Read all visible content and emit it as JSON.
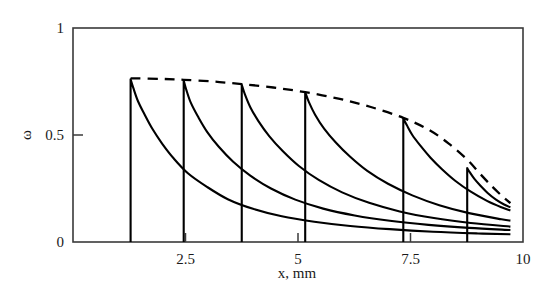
{
  "chart_data": {
    "type": "line",
    "title": "",
    "xlabel": "x, mm",
    "ylabel": "ω",
    "xlim": [
      0,
      10
    ],
    "ylim": [
      0,
      1
    ],
    "grid": false,
    "legend": "none",
    "xticks": [
      {
        "value": 2.5,
        "label": "2.5"
      },
      {
        "value": 5,
        "label": "5"
      },
      {
        "value": 7.5,
        "label": "7.5"
      },
      {
        "value": 10,
        "label": "10"
      }
    ],
    "yticks": [
      {
        "value": 0,
        "label": "0"
      },
      {
        "value": 0.5,
        "label": "0.5"
      },
      {
        "value": 1,
        "label": "1"
      }
    ],
    "series": [
      {
        "name": "profile-1",
        "style": "solid",
        "front_x": 1.28,
        "peak_y": 0.76,
        "points": [
          [
            1.28,
            0.0
          ],
          [
            1.28,
            0.76
          ],
          [
            1.34,
            0.72
          ],
          [
            1.44,
            0.66
          ],
          [
            1.58,
            0.6
          ],
          [
            1.76,
            0.53
          ],
          [
            1.98,
            0.46
          ],
          [
            2.24,
            0.39
          ],
          [
            2.56,
            0.32
          ],
          [
            2.96,
            0.26
          ],
          [
            3.44,
            0.2
          ],
          [
            4.0,
            0.155
          ],
          [
            4.64,
            0.12
          ],
          [
            5.36,
            0.095
          ],
          [
            6.16,
            0.075
          ],
          [
            7.04,
            0.06
          ],
          [
            8.0,
            0.048
          ],
          [
            9.0,
            0.04
          ],
          [
            9.72,
            0.036
          ]
        ]
      },
      {
        "name": "profile-2",
        "style": "solid",
        "front_x": 2.46,
        "peak_y": 0.755,
        "points": [
          [
            2.46,
            0.0
          ],
          [
            2.46,
            0.755
          ],
          [
            2.52,
            0.71
          ],
          [
            2.62,
            0.65
          ],
          [
            2.78,
            0.585
          ],
          [
            2.98,
            0.515
          ],
          [
            3.24,
            0.445
          ],
          [
            3.56,
            0.375
          ],
          [
            3.94,
            0.31
          ],
          [
            4.4,
            0.25
          ],
          [
            4.94,
            0.198
          ],
          [
            5.56,
            0.156
          ],
          [
            6.26,
            0.124
          ],
          [
            7.04,
            0.099
          ],
          [
            7.9,
            0.08
          ],
          [
            8.8,
            0.066
          ],
          [
            9.72,
            0.056
          ]
        ]
      },
      {
        "name": "profile-3",
        "style": "solid",
        "front_x": 3.75,
        "peak_y": 0.735,
        "points": [
          [
            3.75,
            0.0
          ],
          [
            3.75,
            0.735
          ],
          [
            3.82,
            0.69
          ],
          [
            3.94,
            0.63
          ],
          [
            4.12,
            0.565
          ],
          [
            4.36,
            0.495
          ],
          [
            4.66,
            0.425
          ],
          [
            5.02,
            0.355
          ],
          [
            5.46,
            0.29
          ],
          [
            5.98,
            0.232
          ],
          [
            6.58,
            0.183
          ],
          [
            7.26,
            0.143
          ],
          [
            8.02,
            0.112
          ],
          [
            8.84,
            0.089
          ],
          [
            9.72,
            0.072
          ]
        ]
      },
      {
        "name": "profile-4",
        "style": "solid",
        "front_x": 5.16,
        "peak_y": 0.7,
        "points": [
          [
            5.16,
            0.0
          ],
          [
            5.16,
            0.7
          ],
          [
            5.24,
            0.655
          ],
          [
            5.38,
            0.595
          ],
          [
            5.58,
            0.53
          ],
          [
            5.84,
            0.465
          ],
          [
            6.16,
            0.398
          ],
          [
            6.54,
            0.332
          ],
          [
            7.0,
            0.272
          ],
          [
            7.54,
            0.218
          ],
          [
            8.14,
            0.172
          ],
          [
            8.8,
            0.135
          ],
          [
            9.52,
            0.106
          ],
          [
            9.72,
            0.1
          ]
        ]
      },
      {
        "name": "profile-5",
        "style": "solid",
        "front_x": 7.34,
        "peak_y": 0.578,
        "points": [
          [
            7.34,
            0.0
          ],
          [
            7.34,
            0.578
          ],
          [
            7.42,
            0.545
          ],
          [
            7.54,
            0.5
          ],
          [
            7.72,
            0.45
          ],
          [
            7.94,
            0.395
          ],
          [
            8.2,
            0.34
          ],
          [
            8.5,
            0.285
          ],
          [
            8.84,
            0.235
          ],
          [
            9.2,
            0.192
          ],
          [
            9.52,
            0.162
          ],
          [
            9.72,
            0.147
          ]
        ]
      },
      {
        "name": "profile-6",
        "style": "solid",
        "front_x": 8.76,
        "peak_y": 0.345,
        "points": [
          [
            8.76,
            0.0
          ],
          [
            8.76,
            0.345
          ],
          [
            8.82,
            0.325
          ],
          [
            8.92,
            0.295
          ],
          [
            9.06,
            0.262
          ],
          [
            9.22,
            0.228
          ],
          [
            9.4,
            0.198
          ],
          [
            9.58,
            0.175
          ],
          [
            9.72,
            0.162
          ]
        ]
      },
      {
        "name": "envelope",
        "style": "dashed",
        "points": [
          [
            1.28,
            0.765
          ],
          [
            2.0,
            0.762
          ],
          [
            2.46,
            0.758
          ],
          [
            3.1,
            0.75
          ],
          [
            3.75,
            0.738
          ],
          [
            4.45,
            0.722
          ],
          [
            5.16,
            0.7
          ],
          [
            5.9,
            0.67
          ],
          [
            6.6,
            0.632
          ],
          [
            7.34,
            0.58
          ],
          [
            7.9,
            0.525
          ],
          [
            8.35,
            0.46
          ],
          [
            8.76,
            0.385
          ],
          [
            9.05,
            0.318
          ],
          [
            9.32,
            0.258
          ],
          [
            9.56,
            0.21
          ],
          [
            9.72,
            0.182
          ]
        ]
      }
    ]
  },
  "axes": {
    "frame": {
      "x0_px": 73,
      "x1_px": 523,
      "y0_px": 242,
      "y1_px": 28
    }
  }
}
